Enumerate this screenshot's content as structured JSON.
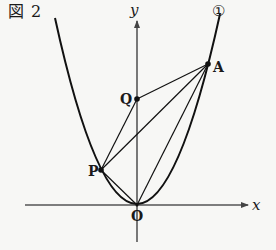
{
  "figure": {
    "title": "図 2",
    "curve_label": "①",
    "axes": {
      "x_label": "x",
      "y_label": "y"
    },
    "points": {
      "O": {
        "label": "O",
        "px": [
          137,
          205
        ]
      },
      "A": {
        "label": "A",
        "px": [
          208,
          64
        ]
      },
      "P": {
        "label": "P",
        "px": [
          101,
          170
        ]
      },
      "Q": {
        "label": "Q",
        "px": [
          137,
          99
        ]
      }
    },
    "segments": [
      [
        "P",
        "O"
      ],
      [
        "P",
        "Q"
      ],
      [
        "P",
        "A"
      ],
      [
        "Q",
        "A"
      ],
      [
        "O",
        "A"
      ]
    ],
    "curve": {
      "type": "parabola",
      "equation_form": "y = a x^2",
      "vertex": "O"
    },
    "colors": {
      "line": "#111111",
      "axis": "#555555",
      "background": "#f7f7f5"
    }
  }
}
